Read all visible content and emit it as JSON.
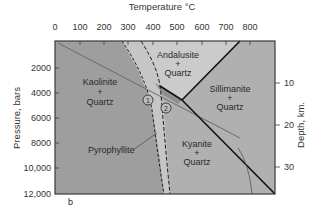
{
  "diagram": {
    "type": "phase-diagram",
    "panel_label": "b",
    "top_axis": {
      "title": "Temperature °C",
      "ticks": [
        "0",
        "100",
        "200",
        "300",
        "400",
        "500",
        "600",
        "700",
        "800"
      ]
    },
    "left_axis": {
      "title": "Pressure, bars",
      "ticks": [
        "2000",
        "4000",
        "6000",
        "8000",
        "10,000",
        "12,000"
      ]
    },
    "right_axis": {
      "title": "Depth, km.",
      "ticks": [
        "10",
        "20",
        "30"
      ]
    },
    "fields": {
      "kaolinite": [
        "Kaolinite",
        "+",
        "Quartz"
      ],
      "andalusite": [
        "Andalusite",
        "+",
        "Quartz"
      ],
      "sillimanite": [
        "Sillimanite",
        "+",
        "Quartz"
      ],
      "kyanite": [
        "Kyanite",
        "+",
        "Quartz"
      ],
      "pyrophyllite": "Pyrophyllite"
    },
    "markers": [
      "1",
      "2"
    ],
    "colors": {
      "kaolinite_field": "#9e9e9e",
      "pyrophyllite_field": "#c4c4c4",
      "aluminosilicate_field": "#b0b0b0",
      "andalusite_field": "#c9c9c9",
      "frame": "#3a3a3a",
      "boundary": "#1a1a1a"
    }
  }
}
